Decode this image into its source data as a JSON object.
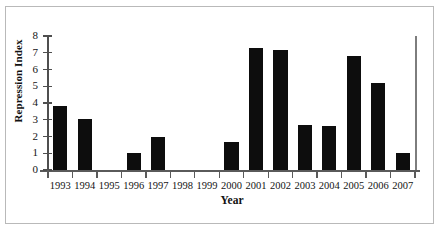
{
  "chart_data": {
    "type": "bar",
    "title": "",
    "xlabel": "Year",
    "ylabel": "Repression Index",
    "categories": [
      "1993",
      "1994",
      "1995",
      "1996",
      "1997",
      "1998",
      "1999",
      "2000",
      "2001",
      "2002",
      "2003",
      "2004",
      "2005",
      "2006",
      "2007"
    ],
    "values": [
      3.8,
      3.05,
      0,
      1.0,
      2.0,
      0,
      0,
      1.65,
      7.3,
      7.15,
      2.7,
      2.65,
      6.8,
      5.2,
      1.0
    ],
    "ylim": [
      0,
      8
    ],
    "y_ticks": [
      0,
      1,
      2,
      3,
      4,
      5,
      6,
      7,
      8
    ],
    "y_tick_labels": [
      "0",
      "1",
      "2",
      "3",
      "4",
      "5",
      "6",
      "7",
      "8"
    ],
    "grid": false,
    "legend": null,
    "bar_color": "#0d0d0d",
    "axis_color": "#4f4f4f",
    "frame_color": "#b9b9b9",
    "background": "#ffffff"
  }
}
